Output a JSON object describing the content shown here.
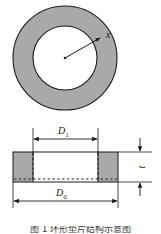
{
  "figure": {
    "type": "engineering-diagram",
    "views": {
      "plan": {
        "name": "top-plan-view",
        "shape": "annulus",
        "fill_color": "#a9a9a9",
        "stroke_color": "#1a1a1a",
        "bore_fill": "#ffffff",
        "center_x": 65,
        "center_y": 58,
        "outer_radius": 52,
        "inner_radius": 32,
        "radius_label": "x",
        "radius_arrow": {
          "from_x": 65,
          "from_y": 58,
          "to_x": 100,
          "to_y": 38
        },
        "label_x_pos": {
          "x": 106,
          "y": 35
        }
      },
      "section": {
        "name": "cross-section-view",
        "fill_color": "#a9a9a9",
        "stroke_color": "#1a1a1a",
        "hidden_line_style": "dashed",
        "left": 13,
        "right": 118,
        "top": 152,
        "bottom": 182,
        "bore_left": 33,
        "bore_right": 98
      }
    },
    "dimensions": [
      {
        "name": "inner-diameter",
        "label": "D",
        "subscript": "1",
        "orientation": "horizontal",
        "position": "above-section",
        "from_x": 33,
        "to_x": 98,
        "y": 139,
        "label_x": 61,
        "label_y": 133
      },
      {
        "name": "outer-diameter",
        "label": "D",
        "subscript": "0",
        "orientation": "horizontal",
        "position": "below-section",
        "from_x": 13,
        "to_x": 118,
        "y": 201,
        "label_x": 59,
        "label_y": 196
      },
      {
        "name": "thickness",
        "label": "t",
        "subscript": "",
        "orientation": "vertical",
        "position": "right-of-section",
        "from_y": 152,
        "to_y": 182,
        "x": 140,
        "label_x": 145,
        "label_y": 167
      }
    ],
    "caption": {
      "text": "图 1  环形垫片结构示意图",
      "clipped": true
    }
  },
  "colors": {
    "gray_fill": "#a9a9a9",
    "line": "#1a1a1a",
    "background": "#ffffff",
    "caption_text": "#3a3a3a"
  }
}
